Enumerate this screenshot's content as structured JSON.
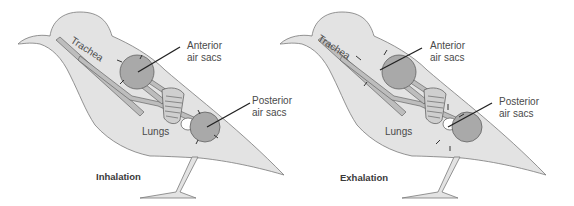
{
  "diagrams": [
    {
      "title": "Inhalation",
      "labels": {
        "trachea": "Trachea",
        "anterior_line1": "Anterior",
        "anterior_line2": "air sacs",
        "posterior_line1": "Posterior",
        "posterior_line2": "air sacs",
        "lungs": "Lungs"
      }
    },
    {
      "title": "Exhalation",
      "labels": {
        "trachea": "Trachea",
        "anterior_line1": "Anterior",
        "anterior_line2": "air sacs",
        "posterior_line1": "Posterior",
        "posterior_line2": "air sacs",
        "lungs": "Lungs"
      }
    }
  ],
  "colors": {
    "body_fill": "#e3e3e3",
    "body_stroke": "#7a7a7a",
    "sac_fill": "#a9a9a9",
    "tube_fill": "#bdbdbd",
    "line": "#222222"
  }
}
